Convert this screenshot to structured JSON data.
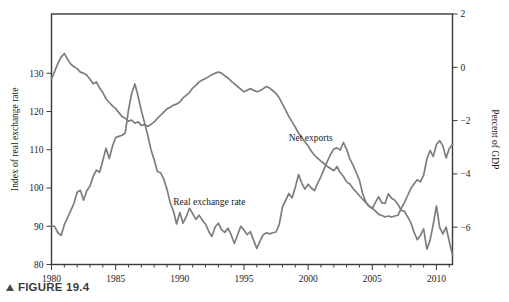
{
  "figure": {
    "caption_marker": "▲",
    "caption": "FIGURE 19.4"
  },
  "labels": {
    "left_axis_title": "Index of real exchange rate",
    "right_axis_title": "Percent of GDP",
    "series_net_exports": "Net exports",
    "series_real_exchange_rate": "Real exchange rate"
  },
  "colors": {
    "line": "#7d7d7d",
    "frame": "#3a3a3a",
    "text": "#1a1a1a"
  },
  "chart_data": {
    "type": "line",
    "title": "FIGURE 19.4",
    "xlabel": "",
    "ylabel": "Index of real exchange rate",
    "y2label": "Percent of GDP",
    "grid": false,
    "legend": "inline-annotations",
    "xlim": [
      1980,
      2011.25
    ],
    "xticks": [
      1980,
      1985,
      1990,
      1995,
      2000,
      2005,
      2010
    ],
    "xtick_labels": [
      "1980",
      "1985",
      "1990",
      "1995",
      "2000",
      "2005",
      "2010"
    ],
    "xminor_step": 1,
    "ylim": [
      80,
      145.5
    ],
    "yticks": [
      80,
      90,
      100,
      110,
      120,
      130
    ],
    "ytick_labels": [
      "80",
      "90",
      "100",
      "110",
      "120",
      "130"
    ],
    "y2lim": [
      -7.4,
      2
    ],
    "y2ticks": [
      2,
      0,
      -2,
      -4,
      -6
    ],
    "y2tick_labels": [
      "2",
      "0",
      "−2",
      "−4",
      "−6"
    ],
    "series": [
      {
        "name": "Real exchange rate",
        "axis": "left",
        "units": "index",
        "label_x": 1992.3,
        "label_y": 95.5,
        "x": [
          1980.0,
          1980.25,
          1980.5,
          1980.75,
          1981.0,
          1981.25,
          1981.5,
          1981.75,
          1982.0,
          1982.25,
          1982.5,
          1982.75,
          1983.0,
          1983.25,
          1983.5,
          1983.75,
          1984.0,
          1984.25,
          1984.5,
          1984.75,
          1985.0,
          1985.25,
          1985.5,
          1985.75,
          1986.0,
          1986.25,
          1986.5,
          1986.75,
          1987.0,
          1987.25,
          1987.5,
          1987.75,
          1988.0,
          1988.25,
          1988.5,
          1988.75,
          1989.0,
          1989.25,
          1989.5,
          1989.75,
          1990.0,
          1990.25,
          1990.5,
          1990.75,
          1991.0,
          1991.25,
          1991.5,
          1991.75,
          1992.0,
          1992.25,
          1992.5,
          1992.75,
          1993.0,
          1993.25,
          1993.5,
          1993.75,
          1994.0,
          1994.25,
          1994.5,
          1994.75,
          1995.0,
          1995.25,
          1995.5,
          1995.75,
          1996.0,
          1996.25,
          1996.5,
          1996.75,
          1997.0,
          1997.25,
          1997.5,
          1997.75,
          1998.0,
          1998.25,
          1998.5,
          1998.75,
          1999.0,
          1999.25,
          1999.5,
          1999.75,
          2000.0,
          2000.25,
          2000.5,
          2000.75,
          2001.0,
          2001.25,
          2001.5,
          2001.75,
          2002.0,
          2002.25,
          2002.5,
          2002.75,
          2003.0,
          2003.25,
          2003.5,
          2003.75,
          2004.0,
          2004.25,
          2004.5,
          2004.75,
          2005.0,
          2005.25,
          2005.5,
          2005.75,
          2006.0,
          2006.25,
          2006.5,
          2006.75,
          2007.0,
          2007.25,
          2007.5,
          2007.75,
          2008.0,
          2008.25,
          2008.5,
          2008.75,
          2009.0,
          2009.25,
          2009.5,
          2009.75,
          2010.0,
          2010.25,
          2010.5,
          2010.75,
          2011.0,
          2011.25
        ],
        "y": [
          90.2,
          89.9,
          88.3,
          87.6,
          90.4,
          92.2,
          94.1,
          96.0,
          98.9,
          99.4,
          96.8,
          99.3,
          100.5,
          103.1,
          104.7,
          104.1,
          107.2,
          110.4,
          107.7,
          110.9,
          113.2,
          113.5,
          113.8,
          114.4,
          120.4,
          124.8,
          127.2,
          124.0,
          120.2,
          117.1,
          113.8,
          110.1,
          107.4,
          104.3,
          104.0,
          102.3,
          99.7,
          96.1,
          94.0,
          90.6,
          93.6,
          90.8,
          92.5,
          94.7,
          93.3,
          91.8,
          92.9,
          91.6,
          90.6,
          88.7,
          87.3,
          89.8,
          90.8,
          89.1,
          88.4,
          89.5,
          87.8,
          85.5,
          87.7,
          90.0,
          89.0,
          87.8,
          88.6,
          86.3,
          84.2,
          86.1,
          87.8,
          88.3,
          88.0,
          88.3,
          88.5,
          90.5,
          95.1,
          96.8,
          98.6,
          97.4,
          100.2,
          103.5,
          101.3,
          99.7,
          101.0,
          100.0,
          99.3,
          101.3,
          103.0,
          105.0,
          107.0,
          108.8,
          110.2,
          110.5,
          109.9,
          111.9,
          110.1,
          107.6,
          106.0,
          104.0,
          102.0,
          98.5,
          96.3,
          95.2,
          94.6,
          96.3,
          97.7,
          96.1,
          96.0,
          98.5,
          97.3,
          96.8,
          95.7,
          94.2,
          93.9,
          92.5,
          91.0,
          88.5,
          86.5,
          87.6,
          89.3,
          84.0,
          86.3,
          90.5,
          95.3,
          89.7,
          88.0,
          89.8,
          86.0,
          82.5
        ]
      },
      {
        "name": "Net exports",
        "axis": "right",
        "units": "percent of GDP",
        "label_x": 2000.2,
        "label_y": -2.75,
        "x": [
          1980.0,
          1980.25,
          1980.5,
          1980.75,
          1981.0,
          1981.25,
          1981.5,
          1981.75,
          1982.0,
          1982.25,
          1982.5,
          1982.75,
          1983.0,
          1983.25,
          1983.5,
          1983.75,
          1984.0,
          1984.25,
          1984.5,
          1984.75,
          1985.0,
          1985.25,
          1985.5,
          1985.75,
          1986.0,
          1986.25,
          1986.5,
          1986.75,
          1987.0,
          1987.25,
          1987.5,
          1987.75,
          1988.0,
          1988.25,
          1988.5,
          1988.75,
          1989.0,
          1989.25,
          1989.5,
          1989.75,
          1990.0,
          1990.25,
          1990.5,
          1990.75,
          1991.0,
          1991.25,
          1991.5,
          1991.75,
          1992.0,
          1992.25,
          1992.5,
          1992.75,
          1993.0,
          1993.25,
          1993.5,
          1993.75,
          1994.0,
          1994.25,
          1994.5,
          1994.75,
          1995.0,
          1995.25,
          1995.5,
          1995.75,
          1996.0,
          1996.25,
          1996.5,
          1996.75,
          1997.0,
          1997.25,
          1997.5,
          1997.75,
          1998.0,
          1998.25,
          1998.5,
          1998.75,
          1999.0,
          1999.25,
          1999.5,
          1999.75,
          2000.0,
          2000.25,
          2000.5,
          2000.75,
          2001.0,
          2001.25,
          2001.5,
          2001.75,
          2002.0,
          2002.25,
          2002.5,
          2002.75,
          2003.0,
          2003.25,
          2003.5,
          2003.75,
          2004.0,
          2004.25,
          2004.5,
          2004.75,
          2005.0,
          2005.25,
          2005.5,
          2005.75,
          2006.0,
          2006.25,
          2006.5,
          2006.75,
          2007.0,
          2007.25,
          2007.5,
          2007.75,
          2008.0,
          2008.25,
          2008.5,
          2008.75,
          2009.0,
          2009.25,
          2009.5,
          2009.75,
          2010.0,
          2010.25,
          2010.5,
          2010.75,
          2011.0,
          2011.25
        ],
        "y": [
          -0.45,
          -0.15,
          0.15,
          0.38,
          0.52,
          0.3,
          0.12,
          0.02,
          -0.05,
          -0.18,
          -0.22,
          -0.3,
          -0.45,
          -0.62,
          -0.55,
          -0.78,
          -0.95,
          -1.18,
          -1.32,
          -1.45,
          -1.55,
          -1.7,
          -1.85,
          -1.92,
          -2.02,
          -1.98,
          -2.1,
          -2.04,
          -2.18,
          -2.15,
          -2.22,
          -2.14,
          -2.05,
          -1.92,
          -1.8,
          -1.68,
          -1.56,
          -1.5,
          -1.42,
          -1.38,
          -1.3,
          -1.15,
          -1.05,
          -0.95,
          -0.78,
          -0.68,
          -0.55,
          -0.48,
          -0.42,
          -0.35,
          -0.28,
          -0.22,
          -0.18,
          -0.22,
          -0.32,
          -0.4,
          -0.52,
          -0.62,
          -0.72,
          -0.82,
          -0.92,
          -0.86,
          -0.8,
          -0.86,
          -0.92,
          -0.88,
          -0.8,
          -0.72,
          -0.78,
          -0.88,
          -0.98,
          -1.15,
          -1.38,
          -1.62,
          -1.85,
          -2.05,
          -2.25,
          -2.48,
          -2.62,
          -2.8,
          -2.95,
          -3.15,
          -3.3,
          -3.42,
          -3.52,
          -3.62,
          -3.72,
          -3.8,
          -3.88,
          -3.72,
          -3.95,
          -4.1,
          -4.3,
          -4.38,
          -4.55,
          -4.68,
          -4.82,
          -4.95,
          -5.08,
          -5.2,
          -5.28,
          -5.4,
          -5.52,
          -5.56,
          -5.62,
          -5.58,
          -5.62,
          -5.58,
          -5.55,
          -5.3,
          -5.08,
          -4.82,
          -4.55,
          -4.38,
          -4.22,
          -4.3,
          -4.05,
          -3.45,
          -3.12,
          -3.35,
          -2.9,
          -2.75,
          -2.95,
          -3.4,
          -3.05,
          -2.9
        ]
      }
    ]
  }
}
